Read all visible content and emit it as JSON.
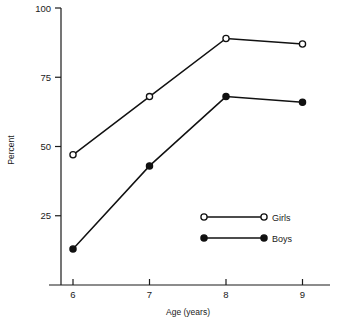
{
  "chart_data": {
    "type": "line",
    "title": "",
    "xlabel": "Age (years)",
    "ylabel": "Percent",
    "x": [
      6,
      7,
      8,
      9
    ],
    "xtick_labels": [
      "6",
      "7",
      "8",
      "9"
    ],
    "xlim": [
      5.6,
      9.4
    ],
    "ylim": [
      0,
      100
    ],
    "ytick_values": [
      25,
      50,
      75,
      100
    ],
    "ytick_labels": [
      "25",
      "50",
      "75",
      "100"
    ],
    "grid": false,
    "legend_position": "inside-lower-right",
    "series": [
      {
        "name": "Girls",
        "marker": "open-circle",
        "color": "#111111",
        "values": [
          47,
          68,
          89,
          87
        ]
      },
      {
        "name": "Boys",
        "marker": "filled-circle",
        "color": "#111111",
        "values": [
          13,
          43,
          68,
          66
        ]
      }
    ],
    "legend": [
      {
        "label": "Girls",
        "marker": "open-circle"
      },
      {
        "label": "Boys",
        "marker": "filled-circle"
      }
    ]
  }
}
